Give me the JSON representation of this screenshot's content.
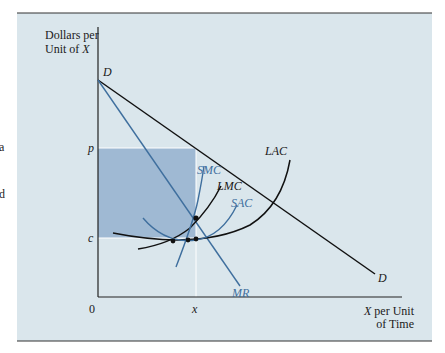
{
  "colors": {
    "panel_bg": "#dae6ec",
    "shaded_region": "#9fb9d3",
    "black_curve": "#111111",
    "blue_curve": "#3f6f9e",
    "guide_line": "#ffffff"
  },
  "edge_text": [
    "a",
    "d"
  ],
  "axes": {
    "y_label_line1": "Dollars per",
    "y_label_line2_prefix": "Unit of ",
    "y_label_line2_var": "X",
    "x_label_line1_var": "X",
    "x_label_line1_suffix": " per Unit",
    "x_label_line2": "of Time",
    "origin": "0"
  },
  "ticks": {
    "p": "p",
    "c": "c",
    "x": "x"
  },
  "curves": {
    "demand_top_label": "D",
    "demand_bottom_label": "D",
    "mr": "MR",
    "smc": "SMC",
    "lmc": "LMC",
    "sac": "SAC",
    "lac": "LAC"
  }
}
